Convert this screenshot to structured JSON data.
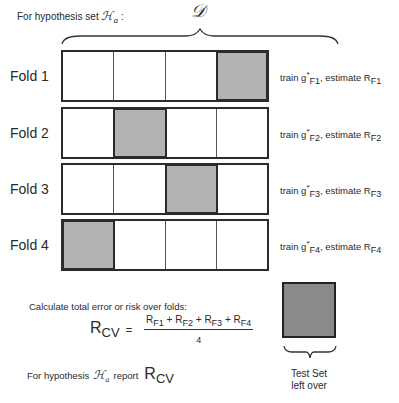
{
  "header": {
    "prefix": "For hypothesis set ",
    "hypothesis_symbol": "ℋ",
    "hypothesis_sub": "a",
    "suffix": " :"
  },
  "dataset_label": "𝒟",
  "folds": [
    {
      "label": "Fold 1",
      "test_index": 3,
      "train_prefix": "train g",
      "train_sub": "F1",
      "estimate_prefix": ", estimate R",
      "estimate_sub": "F1"
    },
    {
      "label": "Fold 2",
      "test_index": 1,
      "train_prefix": "train g",
      "train_sub": "F2",
      "estimate_prefix": ", estimate R",
      "estimate_sub": "F2"
    },
    {
      "label": "Fold 3",
      "test_index": 2,
      "train_prefix": "train g",
      "train_sub": "F3",
      "estimate_prefix": ", estimate R",
      "estimate_sub": "F3"
    },
    {
      "label": "Fold 4",
      "test_index": 0,
      "train_prefix": "train g",
      "train_sub": "F4",
      "estimate_prefix": ", estimate R",
      "estimate_sub": "F4"
    }
  ],
  "calc": {
    "label": "Calculate total error or risk over folds:",
    "lhs_main": "R",
    "lhs_sub": "CV",
    "equals": "=",
    "numerator": [
      {
        "main": "R",
        "sub": "F1"
      },
      {
        "main": "R",
        "sub": "F2"
      },
      {
        "main": "R",
        "sub": "F3"
      },
      {
        "main": "R",
        "sub": "F4"
      }
    ],
    "plus": " + ",
    "denominator": "4"
  },
  "report": {
    "prefix": "For hypothesis",
    "hypothesis_symbol": "ℋ",
    "hypothesis_sub": "a",
    "middle": "report",
    "value_main": "R",
    "value_sub": "CV"
  },
  "test_set": {
    "line1": "Test Set",
    "line2": "left over"
  },
  "colors": {
    "test_fold": "#b3b3b3",
    "test_set": "#8a8a8a",
    "border": "#2b2b2b"
  }
}
